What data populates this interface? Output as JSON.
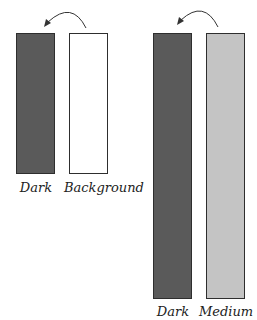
{
  "colors": {
    "dark": "#5a5a5a",
    "background": "#ffffff",
    "medium": "#c4c4c4",
    "border": "#2e2e2e",
    "arrow": "#333333"
  },
  "groups": [
    {
      "name": "short-pair",
      "bars": [
        {
          "label": "Dark",
          "color": "#5a5a5a"
        },
        {
          "label": "Background",
          "color": "#ffffff"
        }
      ]
    },
    {
      "name": "tall-pair",
      "bars": [
        {
          "label": "Dark",
          "color": "#5a5a5a"
        },
        {
          "label": "Medium",
          "color": "#c4c4c4"
        }
      ]
    }
  ]
}
